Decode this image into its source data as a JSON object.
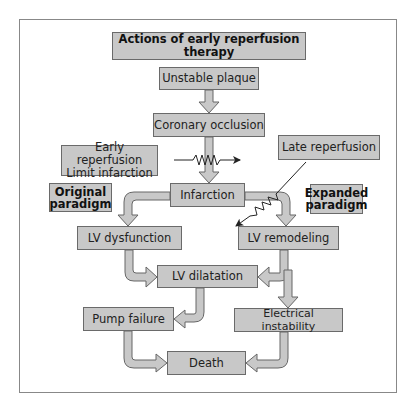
{
  "diagram": {
    "title": "Actions of early reperfusion therapy",
    "nodes": {
      "unstable_plaque": "Unstable plaque",
      "coronary_occlusion": "Coronary occlusion",
      "early_reperfusion_line1": "Early reperfusion",
      "early_reperfusion_line2": "Limit infarction",
      "late_reperfusion": "Late reperfusion",
      "original_paradigm_line1": "Original",
      "original_paradigm_line2": "paradigm",
      "infarction": "Infarction",
      "expanded_paradigm_line1": "Expanded",
      "expanded_paradigm_line2": "paradigm",
      "lv_dysfunction": "LV dysfunction",
      "lv_remodeling": "LV remodeling",
      "lv_dilatation": "LV dilatation",
      "pump_failure": "Pump failure",
      "electrical_instability": "Electrical instability",
      "death": "Death"
    },
    "edges": [
      {
        "from": "Unstable plaque",
        "to": "Coronary occlusion"
      },
      {
        "from": "Coronary occlusion",
        "to": "Infarction"
      },
      {
        "from": "Infarction",
        "to": "LV dysfunction"
      },
      {
        "from": "Infarction",
        "to": "LV remodeling"
      },
      {
        "from": "LV dysfunction",
        "to": "LV dilatation"
      },
      {
        "from": "LV remodeling",
        "to": "LV dilatation"
      },
      {
        "from": "LV remodeling",
        "to": "Electrical instability"
      },
      {
        "from": "LV dilatation",
        "to": "Pump failure"
      },
      {
        "from": "Pump failure",
        "to": "Death"
      },
      {
        "from": "Electrical instability",
        "to": "Death"
      }
    ],
    "inhibitors": [
      {
        "from": "Early reperfusion / Limit infarction",
        "blocks": "Coronary occlusion → Infarction"
      },
      {
        "from": "Late reperfusion",
        "blocks": "Infarction → LV remodeling"
      }
    ],
    "colors": {
      "box_fill": "#c8c8c8",
      "box_border": "#6a6a6a",
      "arrow_fill": "#c8c8c8",
      "frame": "#888888"
    }
  }
}
